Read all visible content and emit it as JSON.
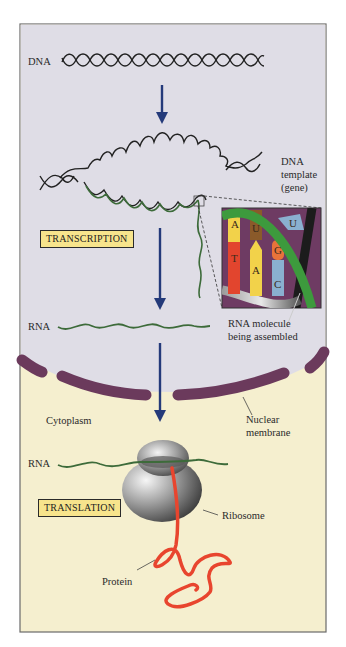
{
  "figure": {
    "colors": {
      "nucleus_bg": "#dfdde6",
      "cytoplasm_bg": "#f5efcf",
      "membrane": "#6b3a5c",
      "arrow": "#243a7a",
      "rna": "#2f6a2f",
      "protein": "#e8452e",
      "label_box": "#f7e48c",
      "inset_bg": "#6e3b63"
    },
    "labels": {
      "dna": "DNA",
      "dna_template_line1": "DNA",
      "dna_template_line2": "template",
      "dna_template_line3": "(gene)",
      "transcription": "TRANSCRIPTION",
      "rna_nucleus": "RNA",
      "rna_molecule_line1": "RNA molecule",
      "rna_molecule_line2": "being assembled",
      "cytoplasm": "Cytoplasm",
      "nuclear_membrane_line1": "Nuclear",
      "nuclear_membrane_line2": "membrane",
      "rna_cytoplasm": "RNA",
      "ribosome": "Ribosome",
      "translation": "TRANSLATION",
      "protein": "Protein"
    },
    "inset": {
      "base_pairs": [
        {
          "top": "A",
          "bottom": "T"
        },
        {
          "top": "U",
          "bottom": "A"
        },
        {
          "top": "G",
          "bottom": "C"
        }
      ],
      "free_nucleotide": "U"
    }
  }
}
